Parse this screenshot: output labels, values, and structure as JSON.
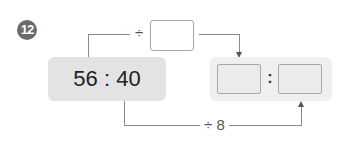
{
  "problem": {
    "number": "12"
  },
  "source_ratio": {
    "text": "56 : 40",
    "left": "56",
    "right": "40"
  },
  "top_operation": {
    "sign": "÷",
    "value": ""
  },
  "bottom_operation": {
    "label": "÷ 8"
  },
  "answer": {
    "left": "",
    "separator": ":",
    "right": ""
  },
  "colors": {
    "badge": "#6b6b6b",
    "source_box": "#e3e3e3",
    "answer_panel": "#efefef",
    "line": "#8a8a8a"
  }
}
